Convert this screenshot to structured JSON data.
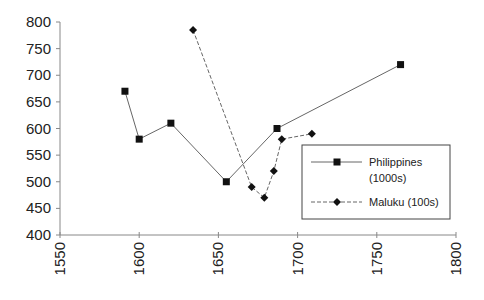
{
  "chart_data": {
    "type": "line",
    "title": "",
    "xlabel": "",
    "ylabel": "",
    "xlim": [
      1550,
      1800
    ],
    "ylim": [
      400,
      800
    ],
    "x_ticks": [
      1550,
      1600,
      1650,
      1700,
      1750,
      1800
    ],
    "y_ticks": [
      400,
      450,
      500,
      550,
      600,
      650,
      700,
      750,
      800
    ],
    "grid": false,
    "legend_position": "lower right (inside)",
    "series": [
      {
        "name": "Philippines (1000s)",
        "legend_lines": [
          "Philippines",
          "(1000s)"
        ],
        "marker": "square",
        "line_style": "solid",
        "x": [
          1591,
          1600,
          1620,
          1655,
          1687,
          1765
        ],
        "y": [
          670,
          580,
          610,
          500,
          600,
          720
        ]
      },
      {
        "name": "Maluku (100s)",
        "legend_lines": [
          "Maluku (100s)"
        ],
        "marker": "diamond",
        "line_style": "dashed",
        "x": [
          1634,
          1671,
          1679,
          1685,
          1690,
          1709
        ],
        "y": [
          785,
          490,
          470,
          520,
          580,
          590
        ]
      }
    ]
  },
  "colors": {
    "axis": "#888888",
    "line": "#666666",
    "marker": "#111111",
    "text": "#222222"
  }
}
